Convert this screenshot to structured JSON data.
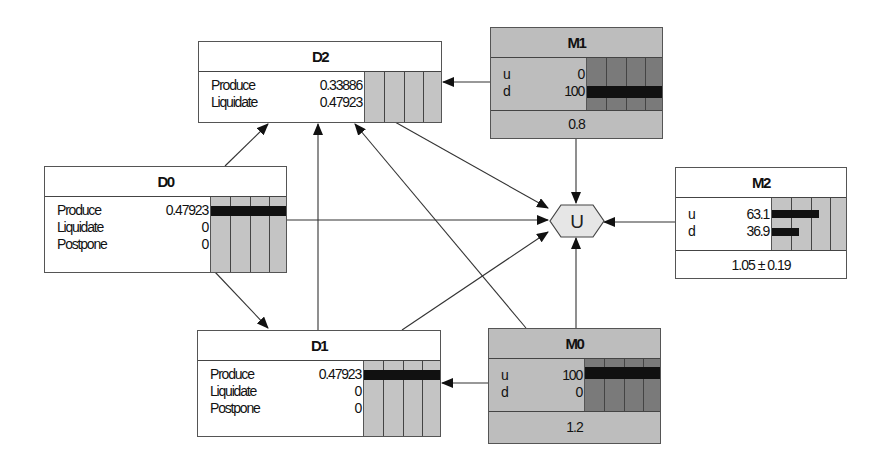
{
  "diagram": {
    "type": "influence-diagram",
    "utility_node": {
      "label": "U"
    },
    "decision_nodes": [
      {
        "id": "D2",
        "title": "D2",
        "states": [
          {
            "label": "Produce",
            "value": "0.33886",
            "bar": 0
          },
          {
            "label": "Liquidate",
            "value": "0.47923",
            "bar": 0
          }
        ]
      },
      {
        "id": "D0",
        "title": "D0",
        "states": [
          {
            "label": "Produce",
            "value": "0.47923",
            "bar": 1
          },
          {
            "label": "Liquidate",
            "value": "0",
            "bar": 0
          },
          {
            "label": "Postpone",
            "value": "0",
            "bar": 0
          }
        ]
      },
      {
        "id": "D1",
        "title": "D1",
        "states": [
          {
            "label": "Produce",
            "value": "0.47923",
            "bar": 1
          },
          {
            "label": "Liquidate",
            "value": "0",
            "bar": 0
          },
          {
            "label": "Postpone",
            "value": "0",
            "bar": 0
          }
        ]
      }
    ],
    "chance_nodes": [
      {
        "id": "M1",
        "title": "M1",
        "observed": true,
        "states": [
          {
            "label": "u",
            "value": "0",
            "bar": 0
          },
          {
            "label": "d",
            "value": "100",
            "bar": 1
          }
        ],
        "footer": "0.8"
      },
      {
        "id": "M2",
        "title": "M2",
        "observed": false,
        "states": [
          {
            "label": "u",
            "value": "63.1",
            "bar": 0.631
          },
          {
            "label": "d",
            "value": "36.9",
            "bar": 0.369
          }
        ],
        "footer": "1.05 ± 0.19"
      },
      {
        "id": "M0",
        "title": "M0",
        "observed": true,
        "states": [
          {
            "label": "u",
            "value": "100",
            "bar": 1
          },
          {
            "label": "d",
            "value": "0",
            "bar": 0
          }
        ],
        "footer": "1.2"
      }
    ],
    "edges": [
      [
        "M1",
        "D2"
      ],
      [
        "M1",
        "U"
      ],
      [
        "D2",
        "U"
      ],
      [
        "D0",
        "D2"
      ],
      [
        "D0",
        "U"
      ],
      [
        "D0",
        "D1"
      ],
      [
        "D1",
        "D2"
      ],
      [
        "D1",
        "U"
      ],
      [
        "M0",
        "D1"
      ],
      [
        "M0",
        "D2"
      ],
      [
        "M0",
        "U"
      ],
      [
        "M2",
        "U"
      ]
    ]
  }
}
